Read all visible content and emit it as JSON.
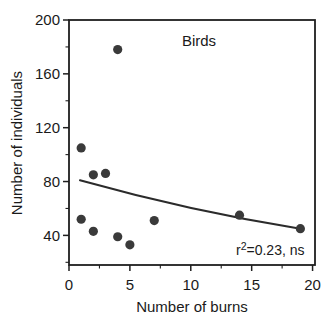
{
  "window": {
    "width": 332,
    "height": 326,
    "background": "#ffffff"
  },
  "chart_data": {
    "type": "scatter",
    "title": "Birds",
    "xlabel": "Number of burns",
    "ylabel": "Number of individuals",
    "points": [
      {
        "x": 1,
        "y": 105
      },
      {
        "x": 1,
        "y": 52
      },
      {
        "x": 2,
        "y": 85
      },
      {
        "x": 2,
        "y": 43
      },
      {
        "x": 3,
        "y": 86
      },
      {
        "x": 4,
        "y": 178
      },
      {
        "x": 4,
        "y": 39
      },
      {
        "x": 5,
        "y": 33
      },
      {
        "x": 7,
        "y": 51
      },
      {
        "x": 14,
        "y": 55
      },
      {
        "x": 19,
        "y": 45
      }
    ],
    "trend_curve": {
      "shape": "quadratic-bezier",
      "start": {
        "x": 0.9,
        "y": 81
      },
      "control": {
        "x": 10,
        "y": 58
      },
      "end": {
        "x": 19,
        "y": 45
      },
      "description": "shallow decreasing regression curve"
    },
    "annotation": {
      "pre": "r",
      "sup": "2",
      "post": "=0.23, ns"
    },
    "xlim": [
      0,
      20.2
    ],
    "ylim": [
      18,
      200
    ],
    "xticks": [
      0,
      5,
      10,
      15,
      20
    ],
    "xticks_minor": [
      2.5,
      7.5,
      12.5,
      17.5
    ],
    "yticks": [
      40,
      80,
      120,
      160,
      200
    ],
    "yticks_minor": [
      20,
      60,
      100,
      140,
      180
    ],
    "grid": false,
    "legend": "none"
  },
  "style": {
    "point_color": "#3a3a3a",
    "point_radius": 4.6,
    "curve_color": "#2b2b2b",
    "curve_width": 2,
    "axis_color": "#1f1f1f",
    "box_width": 1.8,
    "tick_major_len": 6,
    "tick_minor_len": 3.5,
    "tick_label_size": 15,
    "text_color": "#1a1a1a"
  }
}
